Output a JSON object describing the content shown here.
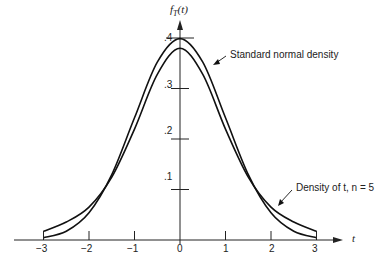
{
  "chart_data": {
    "type": "line",
    "title": "",
    "xlabel": "t",
    "ylabel": "f_T(t)",
    "xlim": [
      -3,
      3
    ],
    "ylim": [
      0,
      0.4
    ],
    "grid": false,
    "x_ticks": [
      "-3",
      "-2",
      "-1",
      "0",
      "1",
      "2",
      "3"
    ],
    "y_ticks": [
      ".1",
      ".2",
      ".3",
      ".4"
    ],
    "x": [
      -3,
      -2.5,
      -2,
      -1.5,
      -1,
      -0.5,
      0,
      0.5,
      1,
      1.5,
      2,
      2.5,
      3
    ],
    "series": [
      {
        "name": "Standard normal density",
        "values": [
          0.0044,
          0.0175,
          0.054,
          0.1295,
          0.242,
          0.3521,
          0.3989,
          0.3521,
          0.242,
          0.1295,
          0.054,
          0.0175,
          0.0044
        ]
      },
      {
        "name": "Density of t, n = 5",
        "values": [
          0.0173,
          0.0356,
          0.0651,
          0.1245,
          0.2197,
          0.3279,
          0.3796,
          0.3279,
          0.2197,
          0.1245,
          0.0651,
          0.0356,
          0.0173
        ]
      }
    ],
    "annotations": [
      {
        "text": "Standard normal density",
        "points_to": "Standard normal density",
        "at_x": 0.7
      },
      {
        "text": "Density of t, n = 5",
        "points_to": "Density of t, n = 5",
        "at_x": 2.3
      }
    ],
    "legend": "none (inline annotations with arrows)"
  },
  "labels": {
    "y_axis_title": "f",
    "y_axis_sub": "T",
    "y_axis_arg": "(t)",
    "x_axis_title": "t",
    "annotation_normal": "Standard normal density",
    "annotation_t": "Density of t, n = 5",
    "x_ticks": [
      "−3",
      "−2",
      "−1",
      "0",
      "1",
      "2",
      "3"
    ],
    "y_ticks": [
      ".1",
      ".2",
      ".3",
      ".4"
    ]
  }
}
